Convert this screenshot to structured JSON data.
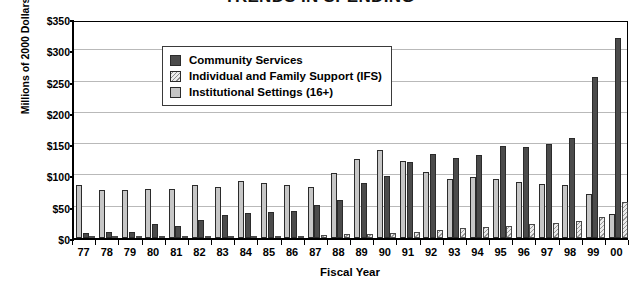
{
  "chart_data": {
    "type": "bar",
    "title": "TRENDS IN SPENDING",
    "xlabel": "Fiscal Year",
    "ylabel": "Millions of 2000 Dollars",
    "ylim": [
      0,
      350
    ],
    "ytick_step": 50,
    "ytick_labels": [
      "$0",
      "$50",
      "$100",
      "$150",
      "$200",
      "$250",
      "$300",
      "$350"
    ],
    "ytick_values": [
      0,
      50,
      100,
      150,
      200,
      250,
      300,
      350
    ],
    "grid": "horizontal",
    "legend_position": "top-left-inside",
    "categories": [
      "77",
      "78",
      "79",
      "80",
      "81",
      "82",
      "83",
      "84",
      "85",
      "86",
      "87",
      "88",
      "89",
      "90",
      "91",
      "92",
      "93",
      "94",
      "95",
      "96",
      "97",
      "98",
      "99",
      "00"
    ],
    "series": [
      {
        "name": "Institutional Settings (16+)",
        "key": "institutional",
        "color": "#c6c6c6",
        "fill": "solid-light-gray",
        "values": [
          85,
          76,
          76,
          79,
          78,
          84,
          81,
          91,
          88,
          84,
          81,
          104,
          127,
          141,
          123,
          106,
          94,
          97,
          95,
          89,
          86,
          84,
          70,
          38
        ]
      },
      {
        "name": "Community Services",
        "key": "community",
        "color": "#4b4b4b",
        "fill": "solid-dark-gray",
        "values": [
          8,
          10,
          9,
          22,
          20,
          29,
          37,
          40,
          41,
          43,
          52,
          60,
          88,
          99,
          122,
          134,
          128,
          133,
          147,
          145,
          150,
          160,
          258,
          320
        ]
      },
      {
        "name": "Individual and Family Support (IFS)",
        "key": "ifs",
        "color": "#ededed",
        "fill": "diagonal-hatch",
        "values": [
          1,
          1,
          2,
          2,
          2,
          3,
          3,
          3,
          3,
          4,
          5,
          6,
          7,
          8,
          10,
          13,
          16,
          18,
          20,
          22,
          24,
          27,
          34,
          58
        ]
      }
    ]
  },
  "legend": {
    "entries": [
      {
        "label": "Community Services",
        "key": "community"
      },
      {
        "label": "Individual and Family Support (IFS)",
        "key": "ifs"
      },
      {
        "label": "Institutional Settings (16+)",
        "key": "institutional"
      }
    ]
  }
}
